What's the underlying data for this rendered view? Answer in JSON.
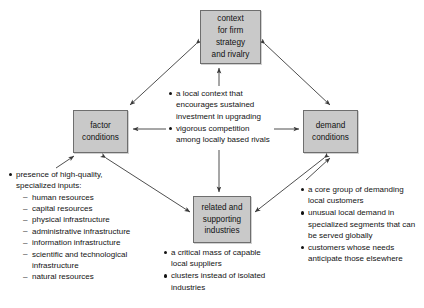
{
  "diagram": {
    "box_fill": "#c9c9c9",
    "box_border": "#6e6e6e",
    "arrow_color": "#3a3a3a",
    "nodes": {
      "context": {
        "line1": "context",
        "line2": "for firm",
        "line3": "strategy",
        "line4": "and rivalry"
      },
      "factor": {
        "line1": "factor",
        "line2": "conditions"
      },
      "demand": {
        "line1": "demand",
        "line2": "conditions"
      },
      "related": {
        "line1": "related and",
        "line2": "supporting",
        "line3": "industries"
      }
    },
    "center_notes": [
      "a local context that encourages sustained investment in upgrading",
      "vigorous competition among locally based rivals"
    ],
    "factor_notes": {
      "lead": "presence of high-quality, specialized inputs:",
      "items": [
        "human resources",
        "capital resources",
        "physical infrastructure",
        "administrative infrastructure",
        "information infrastructure",
        "scientific and technological infrastructure",
        "natural resources"
      ]
    },
    "demand_notes": [
      "a core group of demanding local customers",
      "unusual local demand in specialized segments that can be served globally",
      "customers whose needs anticipate those elsewhere"
    ],
    "related_notes": [
      "a critical mass of capable local suppliers",
      "clusters instead of isolated industries"
    ]
  }
}
